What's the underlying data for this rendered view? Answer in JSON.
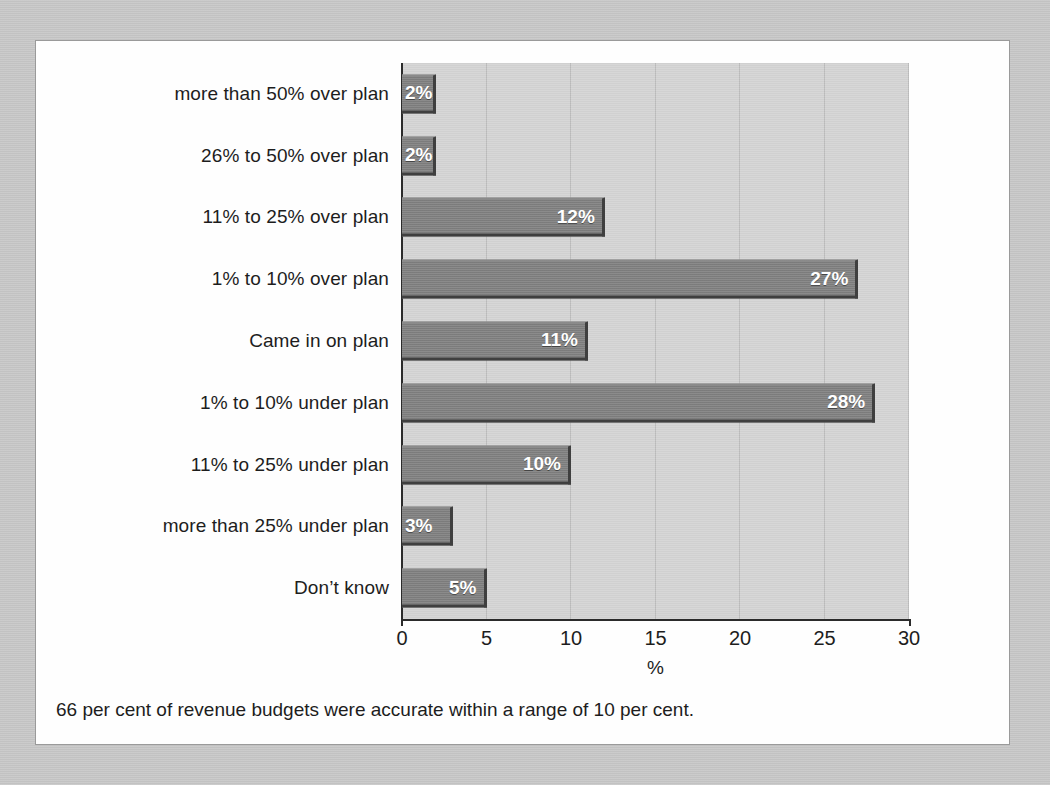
{
  "caption": "66 per cent of revenue budgets were accurate within a range of 10 per cent.",
  "colors": {
    "page_background": "#c9c9c9",
    "card_background": "#fefefe",
    "plot_background": "#d5d5d5",
    "bar_fill": "#828282",
    "bar_shadow": "#3f3f3f",
    "gridline": "#bdbdbd",
    "axis": "#2b2b2b",
    "text": "#1d1d1d",
    "value_label": "#ffffff"
  },
  "chart_data": {
    "type": "bar",
    "orientation": "horizontal",
    "title": "",
    "xlabel": "%",
    "ylabel": "",
    "xlim": [
      0,
      30
    ],
    "xticks": [
      0,
      5,
      10,
      15,
      20,
      25,
      30
    ],
    "xtick_labels": [
      "0",
      "5",
      "10",
      "15",
      "20",
      "25",
      "30"
    ],
    "grid": "vertical",
    "legend": "none",
    "categories": [
      "more than 50% over plan",
      "26% to 50% over plan",
      "11% to 25% over plan",
      "1% to 10% over plan",
      "Came in on plan",
      "1% to 10% under plan",
      "11% to 25% under plan",
      "more than 25% under plan",
      "Don’t know"
    ],
    "values": [
      2,
      2,
      12,
      27,
      11,
      28,
      10,
      3,
      5
    ],
    "value_labels": [
      "2%",
      "2%",
      "12%",
      "27%",
      "11%",
      "28%",
      "10%",
      "3%",
      "5%"
    ]
  }
}
